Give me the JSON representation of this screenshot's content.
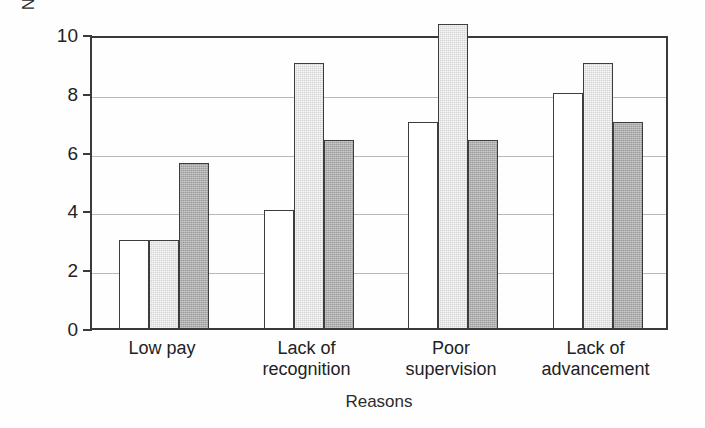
{
  "chart_data": {
    "type": "bar",
    "title": "",
    "subtitle": "",
    "xlabel": "Reasons",
    "ylabel": "Number of Occurrences",
    "categories": [
      "Low pay",
      "Lack of\nrecognition",
      "Poor\nsupervision",
      "Lack of\nadvancement"
    ],
    "series": [
      {
        "name": "series-1",
        "fill": "white",
        "color": "#ffffff",
        "values": [
          3,
          4,
          7,
          8
        ]
      },
      {
        "name": "series-2",
        "fill": "light-gray",
        "color": "#d4d4d4",
        "values": [
          3,
          9,
          10.2,
          9
        ]
      },
      {
        "name": "series-3",
        "fill": "dark-gray",
        "color": "#9b9b9b",
        "values": [
          5.6,
          6.4,
          6.4,
          7
        ]
      }
    ],
    "ylim": [
      0,
      10
    ],
    "yticks": [
      0,
      2,
      4,
      6,
      8,
      10
    ],
    "ytick_labels": [
      "0",
      "2",
      "4",
      "6",
      "8",
      "10"
    ],
    "grid": true,
    "grid_axis": "y",
    "legend": "none",
    "xtick_labels": [
      "Low pay",
      "Lack of recognition",
      "Poor supervision",
      "Lack of advancement"
    ]
  },
  "axis_colors": {
    "frame": "#3a3a3a",
    "gridline": "#b9b9b9",
    "text": "#222222"
  }
}
